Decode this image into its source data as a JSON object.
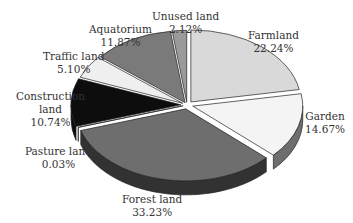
{
  "chart_data": {
    "type": "pie",
    "style": "3d-exploded",
    "title": "",
    "categories": [
      "Farmland",
      "Garden",
      "Forest land",
      "Pasture land",
      "Construction land",
      "Traffic land",
      "Aquatorium",
      "Unused land"
    ],
    "values": [
      22.24,
      14.67,
      33.23,
      0.03,
      10.74,
      5.1,
      11.87,
      2.12
    ],
    "unit": "%",
    "colors": [
      "#d9d9d9",
      "#f4f4f4",
      "#6e6e6e",
      "#a8a8a8",
      "#0d0d0d",
      "#efefef",
      "#7a7a7a",
      "#9a9a9a"
    ],
    "legend": "none (labels placed next to slices)"
  },
  "labels": [
    {
      "name": "Farmland",
      "pct": "22.24%"
    },
    {
      "name": "Garden",
      "pct": "14.67%"
    },
    {
      "name": "Forest land",
      "pct": "33.23%"
    },
    {
      "name": "Pasture land",
      "pct": "0.03%"
    },
    {
      "name": "Construction land",
      "pct": "10.74%"
    },
    {
      "name": "Traffic land",
      "pct": "5.10%"
    },
    {
      "name": "Aquatorium",
      "pct": "11.87%"
    },
    {
      "name": "Unused land",
      "pct": "2.12%"
    }
  ]
}
